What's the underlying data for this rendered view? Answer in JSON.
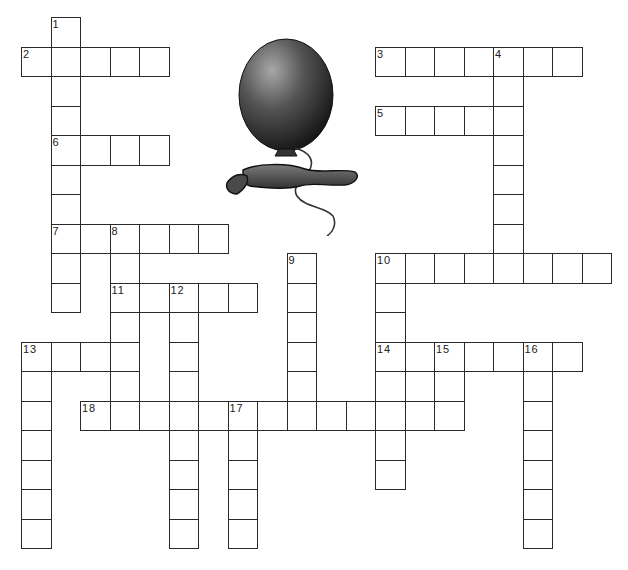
{
  "puzzle": {
    "title": "Balloon crossword",
    "grid": {
      "origin_x": 21,
      "origin_y": 17,
      "cell_size": 29.5,
      "cols": 20,
      "rows": 18
    },
    "colors": {
      "border": "#2a2a2a",
      "cell_bg": "#ffffff",
      "label": "#222222",
      "balloon_dark": "#1e1e1e",
      "balloon_light": "#9a9a9a",
      "string": "#333333"
    },
    "entries": [
      {
        "number": 1,
        "direction": "down",
        "col": 1,
        "row": 0,
        "length": 10
      },
      {
        "number": 2,
        "direction": "across",
        "col": 0,
        "row": 1,
        "length": 5
      },
      {
        "number": 3,
        "direction": "across",
        "col": 12,
        "row": 1,
        "length": 7
      },
      {
        "number": 4,
        "direction": "down",
        "col": 16,
        "row": 1,
        "length": 8
      },
      {
        "number": 5,
        "direction": "across",
        "col": 12,
        "row": 3,
        "length": 5
      },
      {
        "number": 6,
        "direction": "across",
        "col": 1,
        "row": 4,
        "length": 4
      },
      {
        "number": 7,
        "direction": "across",
        "col": 1,
        "row": 7,
        "length": 6
      },
      {
        "number": 8,
        "direction": "down",
        "col": 3,
        "row": 7,
        "length": 6
      },
      {
        "number": 9,
        "direction": "down",
        "col": 9,
        "row": 8,
        "length": 6
      },
      {
        "number": 10,
        "direction": "across",
        "col": 12,
        "row": 8,
        "length": 8
      },
      {
        "number": 10,
        "direction": "down",
        "col": 12,
        "row": 8,
        "length": 8
      },
      {
        "number": 11,
        "direction": "across",
        "col": 3,
        "row": 9,
        "length": 5
      },
      {
        "number": 12,
        "direction": "down",
        "col": 5,
        "row": 9,
        "length": 9
      },
      {
        "number": 13,
        "direction": "across",
        "col": 0,
        "row": 11,
        "length": 4
      },
      {
        "number": 13,
        "direction": "down",
        "col": 0,
        "row": 11,
        "length": 7
      },
      {
        "number": 14,
        "direction": "across",
        "col": 12,
        "row": 11,
        "length": 7
      },
      {
        "number": 15,
        "direction": "down",
        "col": 14,
        "row": 11,
        "length": 3
      },
      {
        "number": 16,
        "direction": "down",
        "col": 17,
        "row": 11,
        "length": 7
      },
      {
        "number": 17,
        "direction": "down",
        "col": 7,
        "row": 13,
        "length": 5
      },
      {
        "number": 18,
        "direction": "across",
        "col": 2,
        "row": 13,
        "length": 12
      }
    ],
    "labels": [
      {
        "text": "1",
        "col": 1,
        "row": 0
      },
      {
        "text": "2",
        "col": 0,
        "row": 1
      },
      {
        "text": "3",
        "col": 12,
        "row": 1
      },
      {
        "text": "4",
        "col": 16,
        "row": 1
      },
      {
        "text": "5",
        "col": 12,
        "row": 3
      },
      {
        "text": "6",
        "col": 1,
        "row": 4
      },
      {
        "text": "7",
        "col": 1,
        "row": 7
      },
      {
        "text": "8",
        "col": 3,
        "row": 7
      },
      {
        "text": "9",
        "col": 9,
        "row": 8
      },
      {
        "text": "10",
        "col": 12,
        "row": 8
      },
      {
        "text": "11",
        "col": 3,
        "row": 9
      },
      {
        "text": "12",
        "col": 5,
        "row": 9
      },
      {
        "text": "13",
        "col": 0,
        "row": 11
      },
      {
        "text": "14",
        "col": 12,
        "row": 11
      },
      {
        "text": "15",
        "col": 14,
        "row": 11
      },
      {
        "text": "16",
        "col": 17,
        "row": 11
      },
      {
        "text": "17",
        "col": 7,
        "row": 13
      },
      {
        "text": "18",
        "col": 2,
        "row": 13
      }
    ],
    "illustration": {
      "icon": "balloon-icon",
      "description": "dark gray balloon with string and deflated balloon"
    }
  }
}
